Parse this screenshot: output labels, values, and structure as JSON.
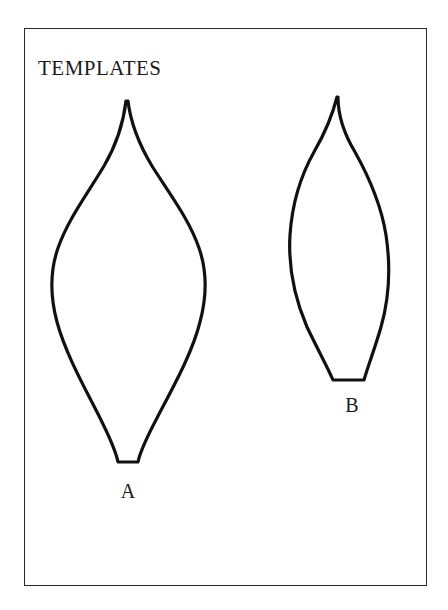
{
  "page": {
    "width": 448,
    "height": 610,
    "background_color": "#ffffff"
  },
  "frame": {
    "name": "figure-border",
    "stroke_color": "#2a2a2a",
    "fill_color": "#ffffff"
  },
  "title": {
    "text": "TEMPLATES"
  },
  "figure": {
    "caption_text": "TEMPLATES",
    "stroke_color": "#111111",
    "fill_color": "#ffffff",
    "shapes": [
      {
        "id": "A",
        "label": "A",
        "description": "large leaf-shaped template outline with pointed apex and narrow flat base",
        "tip_x": 126,
        "tip_y": 101,
        "left_x": 51,
        "right_x": 207,
        "widest_y": 282,
        "base_y": 464,
        "base_left_x": 117,
        "base_right_x": 139,
        "path": "M 126 101 C 124 118 118 142 104 166 C 88 193 68 219 58 248 C 50 271 50 296 57 322 C 66 355 86 390 100 418 C 110 438 116 452 118 462 L 138 462 C 140 452 147 437 157 418 C 172 389 192 354 200 322 C 207 296 207 271 199 248 C 189 219 169 193 152 166 C 137 141 130 118 128 101 Z"
      },
      {
        "id": "B",
        "label": "B",
        "description": "smaller narrower leaf-shaped template outline with pointed apex and flat base",
        "tip_x": 337,
        "tip_y": 97,
        "left_x": 289,
        "right_x": 387,
        "widest_y": 252,
        "base_y": 382,
        "base_left_x": 335,
        "base_right_x": 364,
        "path": "M 337 97 C 333 113 325 133 314 152 C 300 177 292 205 290 235 C 288 268 295 299 307 327 C 318 350 328 368 333 380 L 364 380 C 368 366 375 348 381 327 C 389 299 391 268 386 235 C 381 204 369 177 355 152 C 343 132 338 113 338 97 Z"
      }
    ]
  }
}
